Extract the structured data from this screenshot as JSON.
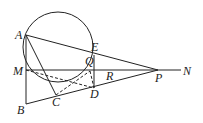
{
  "diagram": {
    "type": "geometry",
    "circle": {
      "cx": 58,
      "cy": 47,
      "r": 35
    },
    "points": {
      "A": {
        "x": 26,
        "y": 35,
        "label": "A",
        "lx": 15,
        "ly": 39
      },
      "M": {
        "x": 26,
        "y": 70,
        "label": "M",
        "lx": 13,
        "ly": 75
      },
      "B": {
        "x": 26,
        "y": 104,
        "label": "B",
        "lx": 17,
        "ly": 114
      },
      "C": {
        "x": 56,
        "y": 95,
        "label": "C",
        "lx": 52,
        "ly": 106
      },
      "D": {
        "x": 94,
        "y": 88,
        "label": "D",
        "lx": 90,
        "ly": 98
      },
      "E": {
        "x": 94,
        "y": 55,
        "label": "E",
        "lx": 91,
        "ly": 51
      },
      "Q": {
        "x": 94,
        "y": 70,
        "label": "Q",
        "lx": 86,
        "ly": 64
      },
      "R": {
        "x": 108,
        "y": 70,
        "label": "R",
        "lx": 106,
        "ly": 80
      },
      "P": {
        "x": 158,
        "y": 70,
        "label": "P",
        "lx": 155,
        "ly": 82
      },
      "N": {
        "x": 181,
        "y": 70,
        "label": "N",
        "lx": 183,
        "ly": 75
      }
    },
    "labels": [
      "A",
      "M",
      "B",
      "C",
      "D",
      "E",
      "Q",
      "R",
      "P",
      "N"
    ]
  }
}
